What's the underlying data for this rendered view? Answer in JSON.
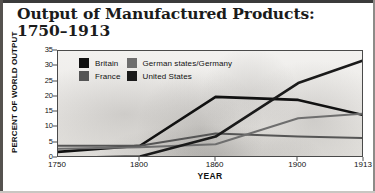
{
  "title": {
    "line1": "Output of Manufactured Products:",
    "line2": "1750–1913"
  },
  "chart_data": {
    "type": "line",
    "xlabel": "YEAR",
    "ylabel": "PERCENT OF WORLD OUTPUT",
    "x": [
      1750,
      1800,
      1860,
      1900,
      1913
    ],
    "xtick_labels": [
      "1750",
      "1800",
      "1860",
      "1900",
      "1913"
    ],
    "ytick_labels": [
      "0",
      "5",
      "10",
      "15",
      "20",
      "25",
      "30",
      "35"
    ],
    "ytick_values": [
      0,
      5,
      10,
      15,
      20,
      25,
      30,
      35
    ],
    "ylim": [
      0,
      35
    ],
    "xlim": [
      1750,
      1913
    ],
    "grid": false,
    "legend_position": "top-left-inside",
    "series": [
      {
        "name": "Britain",
        "color": "#111111",
        "values": [
          2,
          4,
          20,
          19,
          14
        ]
      },
      {
        "name": "France",
        "color": "#555555",
        "values": [
          4,
          4,
          8,
          7,
          6.5
        ]
      },
      {
        "name": "German states/Germany",
        "color": "#6e6e6e",
        "values": [
          3,
          3.5,
          4.5,
          13,
          14.5
        ]
      },
      {
        "name": "United States",
        "color": "#1a1a1a",
        "values": [
          0,
          0.5,
          7,
          24.5,
          32
        ]
      }
    ]
  },
  "legend": {
    "items": [
      {
        "label": "Britain",
        "swatch_color": "#111111"
      },
      {
        "label": "German states/Germany",
        "swatch_color": "#6e6e6e"
      },
      {
        "label": "France",
        "swatch_color": "#555555"
      },
      {
        "label": "United States",
        "swatch_color": "#1a1a1a"
      }
    ]
  }
}
